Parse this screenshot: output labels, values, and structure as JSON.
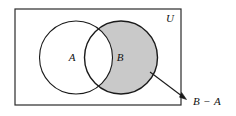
{
  "figure": {
    "universe_label": "U",
    "set_a_label": "A",
    "set_b_label": "B",
    "callout_label": "B − A"
  },
  "colors": {
    "shade": "#c9c9c9",
    "stroke": "#1a1a1a",
    "frame": "#2b2b2b",
    "background": "#ffffff",
    "text": "#111111"
  },
  "geometry": {
    "frame": {
      "x": 15,
      "y": 9,
      "width": 166,
      "height": 96
    },
    "circle_a": {
      "cx": 76,
      "cy": 57.5,
      "r": 36.5
    },
    "circle_b": {
      "cx": 121,
      "cy": 57.5,
      "r": 36.5
    },
    "arrow": {
      "x1": 150,
      "y1": 72,
      "x2": 186,
      "y2": 99
    },
    "label_u": {
      "x": 170,
      "y": 22
    },
    "label_a": {
      "x": 72,
      "y": 61
    },
    "label_b": {
      "x": 118,
      "y": 61
    },
    "label_diff": {
      "x": 196,
      "y": 104
    }
  }
}
